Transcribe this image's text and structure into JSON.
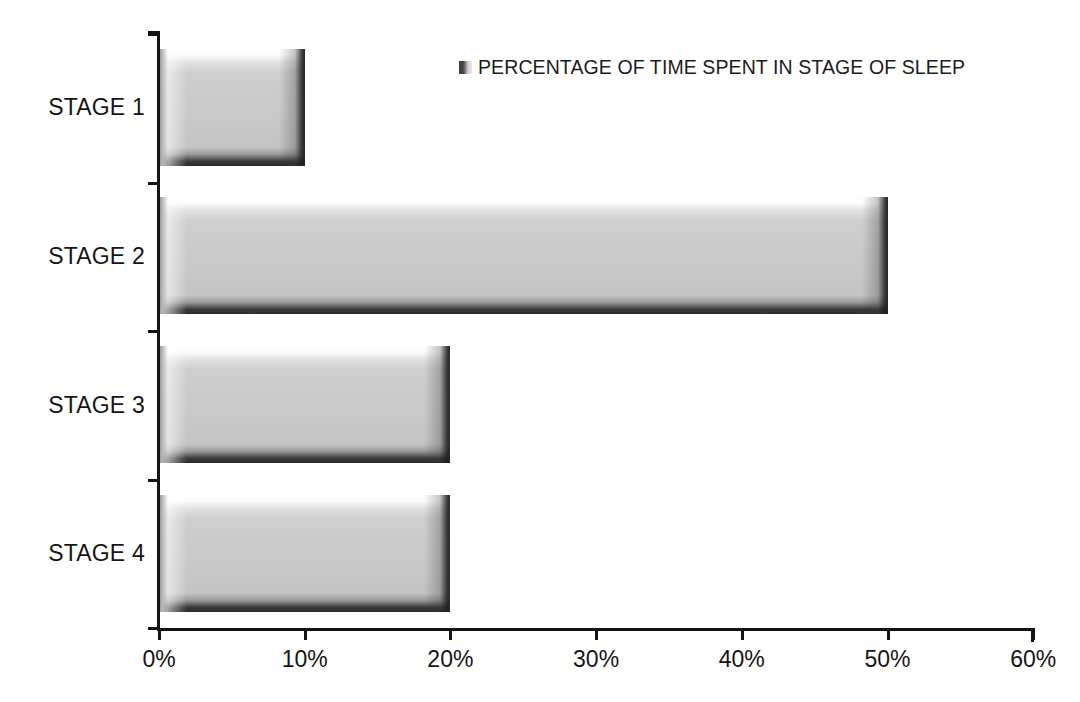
{
  "chart_data": {
    "type": "bar",
    "orientation": "horizontal",
    "title": "",
    "subtitle": "",
    "xlabel": "",
    "ylabel": "",
    "categories": [
      "STAGE 1",
      "STAGE 2",
      "STAGE 3",
      "STAGE 4"
    ],
    "values": [
      10,
      50,
      20,
      20
    ],
    "value_unit": "%",
    "series": [
      {
        "name": "PERCENTAGE OF TIME SPENT IN STAGE OF SLEEP",
        "values": [
          10,
          50,
          20,
          20
        ]
      }
    ],
    "xlim": [
      0,
      60
    ],
    "xticks": [
      0,
      10,
      20,
      30,
      40,
      50,
      60
    ],
    "xticklabels": [
      "0%",
      "10%",
      "20%",
      "30%",
      "40%",
      "50%",
      "60%"
    ],
    "grid": false,
    "legend_position": "top-right",
    "legend_entries": [
      "PERCENTAGE OF TIME SPENT IN STAGE OF SLEEP"
    ],
    "annotations": [],
    "colors": {
      "bar_fill": "#c9c9c9",
      "bar_highlight": "#ffffff",
      "bar_shadow": "#2a2a2a",
      "axis": "#141414",
      "text": "#151515",
      "background": "#ffffff"
    }
  },
  "legend": {
    "label": "PERCENTAGE OF TIME SPENT IN STAGE OF SLEEP",
    "swatch_name": "legend-color-swatch"
  },
  "axes": {
    "x_tick_labels": [
      "0%",
      "10%",
      "20%",
      "30%",
      "40%",
      "50%",
      "60%"
    ],
    "y_tick_labels": [
      "STAGE 1",
      "STAGE 2",
      "STAGE 3",
      "STAGE 4"
    ]
  }
}
